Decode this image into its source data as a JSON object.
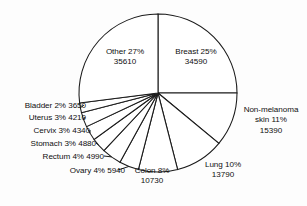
{
  "chart_data": {
    "type": "pie",
    "title": "",
    "subtitle": "",
    "xlabel": "",
    "ylabel": "",
    "legend_position": "none",
    "grid": false,
    "start_angle_deg": 0,
    "direction": "clockwise",
    "value_unit": "cases",
    "categories": [
      "Breast",
      "Non-melanoma skin",
      "Lung",
      "Colon",
      "Ovary",
      "Rectum",
      "Stomach",
      "Cervix",
      "Uterus",
      "Bladder",
      "Other"
    ],
    "values": [
      34590,
      15390,
      13790,
      10730,
      5940,
      4990,
      4880,
      4340,
      4210,
      3650,
      35610
    ],
    "percents": [
      25,
      11,
      10,
      8,
      4,
      4,
      3,
      3,
      3,
      2,
      27
    ],
    "slices": [
      {
        "name": "Breast",
        "percent": 25,
        "value": 34590,
        "label": "Breast 25%",
        "value_label": "34590",
        "placement": "inside"
      },
      {
        "name": "Non-melanoma skin",
        "percent": 11,
        "value": 15390,
        "label": "Non-melanoma",
        "label2": "skin 11%",
        "value_label": "15390",
        "placement": "outside-right"
      },
      {
        "name": "Lung",
        "percent": 10,
        "value": 13790,
        "label": "Lung 10%",
        "value_label": "13790",
        "placement": "outside-right"
      },
      {
        "name": "Colon",
        "percent": 8,
        "value": 10730,
        "label": "Colon 8%",
        "value_label": "10730",
        "placement": "outside-bottom"
      },
      {
        "name": "Ovary",
        "percent": 4,
        "value": 5940,
        "label": "Ovary 4% 5940",
        "placement": "outside-left"
      },
      {
        "name": "Rectum",
        "percent": 4,
        "value": 4990,
        "label": "Rectum 4% 4990",
        "placement": "outside-left"
      },
      {
        "name": "Stomach",
        "percent": 3,
        "value": 4880,
        "label": "Stomach 3% 4880",
        "placement": "outside-left"
      },
      {
        "name": "Cervix",
        "percent": 3,
        "value": 4340,
        "label": "Cervix 3% 4340",
        "placement": "outside-left"
      },
      {
        "name": "Uterus",
        "percent": 3,
        "value": 4210,
        "label": "Uterus 3% 4210",
        "placement": "outside-left"
      },
      {
        "name": "Bladder",
        "percent": 2,
        "value": 3650,
        "label": "Bladder 2% 3650",
        "placement": "outside-left"
      },
      {
        "name": "Other",
        "percent": 27,
        "value": 35610,
        "label": "Other 27%",
        "value_label": "35610",
        "placement": "inside"
      }
    ],
    "total_percent": 100,
    "total_value": 138120
  },
  "labels": {
    "other": {
      "line1": "Other 27%",
      "line2": "35610"
    },
    "breast": {
      "line1": "Breast 25%",
      "line2": "34590"
    },
    "skin": {
      "line1": "Non-melanoma",
      "line2": "skin 11%",
      "line3": "15390"
    },
    "lung": {
      "line1": "Lung 10%",
      "line2": "13790"
    },
    "colon": {
      "line1": "Colon 8%",
      "line2": "10730"
    },
    "ovary": {
      "line1": "Ovary 4% 5940"
    },
    "rectum": {
      "line1": "Rectum 4% 4990"
    },
    "stomach": {
      "line1": "Stomach 3% 4880"
    },
    "cervix": {
      "line1": "Cervix 3% 4340"
    },
    "uterus": {
      "line1": "Uterus 3% 4210"
    },
    "bladder": {
      "line1": "Bladder 2% 3650"
    }
  },
  "colors": {
    "slice_fill": "#ffffff",
    "slice_stroke": "#1a1a1a",
    "text": "#101010",
    "background": "#fdfdfd"
  }
}
